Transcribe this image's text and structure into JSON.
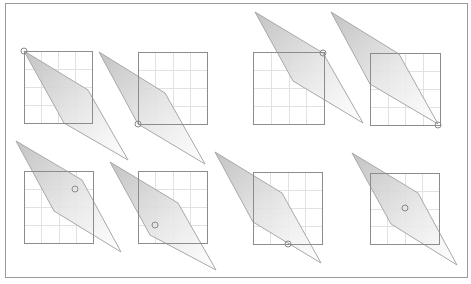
{
  "frame": {
    "x": 5,
    "y": 3,
    "width": 462,
    "height": 274,
    "stroke": "#9a9a9a"
  },
  "colors": {
    "square_stroke": "#8c8c8c",
    "grid_stroke": "#e2e2e2",
    "shape_stroke": "#a8a8a8",
    "shape_fill_dark": "#bdbdbd",
    "shape_fill_light": "#ffffff",
    "marker_stroke": "#8a8a8a"
  },
  "panels": [
    {
      "id": "panel-1",
      "square": [
        24,
        51,
        68,
        72
      ],
      "poly": [
        [
          24,
          51
        ],
        [
          88,
          90
        ],
        [
          128,
          160
        ],
        [
          64,
          123
        ]
      ],
      "marker": [
        24,
        51
      ]
    },
    {
      "id": "panel-2",
      "square": [
        138,
        52,
        69,
        72
      ],
      "poly": [
        [
          99,
          52
        ],
        [
          165,
          93
        ],
        [
          205,
          164
        ],
        [
          138,
          124
        ]
      ],
      "marker": [
        138,
        124
      ]
    },
    {
      "id": "panel-3",
      "square": [
        253,
        52,
        71,
        72
      ],
      "poly": [
        [
          255,
          12
        ],
        [
          323,
          53
        ],
        [
          363,
          123
        ],
        [
          293,
          81
        ]
      ],
      "marker": [
        323,
        53
      ]
    },
    {
      "id": "panel-4",
      "square": [
        370,
        53,
        70,
        72
      ],
      "poly": [
        [
          331,
          12
        ],
        [
          399,
          54
        ],
        [
          438,
          124
        ],
        [
          370,
          84
        ]
      ],
      "marker": [
        438,
        125
      ]
    },
    {
      "id": "panel-5",
      "square": [
        24,
        171,
        69,
        72
      ],
      "poly": [
        [
          16,
          141
        ],
        [
          82,
          180
        ],
        [
          121,
          252
        ],
        [
          54,
          211
        ]
      ],
      "marker": [
        75,
        189
      ]
    },
    {
      "id": "panel-6",
      "square": [
        138,
        171,
        69,
        72
      ],
      "poly": [
        [
          110,
          162
        ],
        [
          178,
          203
        ],
        [
          216,
          270
        ],
        [
          150,
          235
        ]
      ],
      "marker": [
        155,
        225
      ]
    },
    {
      "id": "panel-7",
      "square": [
        253,
        172,
        69,
        72
      ],
      "poly": [
        [
          215,
          152
        ],
        [
          282,
          193
        ],
        [
          321,
          263
        ],
        [
          253,
          222
        ]
      ],
      "marker": [
        288,
        244
      ]
    },
    {
      "id": "panel-8",
      "square": [
        370,
        173,
        69,
        71
      ],
      "poly": [
        [
          352,
          153
        ],
        [
          418,
          193
        ],
        [
          457,
          265
        ],
        [
          391,
          224
        ]
      ],
      "marker": [
        405,
        208
      ]
    }
  ],
  "grid_divisions": 4,
  "marker_radius": 3
}
